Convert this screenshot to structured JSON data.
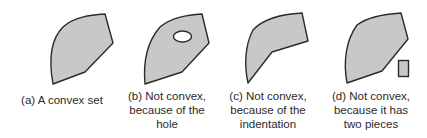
{
  "figure": {
    "colors": {
      "fill": "#c8c8c8",
      "stroke": "#2b2b2b",
      "hole_fill": "#ffffff"
    },
    "panels": [
      {
        "id": "a",
        "caption_lines": [
          "(a) A convex set"
        ]
      },
      {
        "id": "b",
        "caption_lines": [
          "(b) Not convex,",
          "because of the",
          "hole"
        ]
      },
      {
        "id": "c",
        "caption_lines": [
          "(c) Not convex,",
          "because of the",
          "indentation"
        ]
      },
      {
        "id": "d",
        "caption_lines": [
          "(d) Not convex,",
          "because it has",
          "two pieces"
        ]
      }
    ]
  }
}
